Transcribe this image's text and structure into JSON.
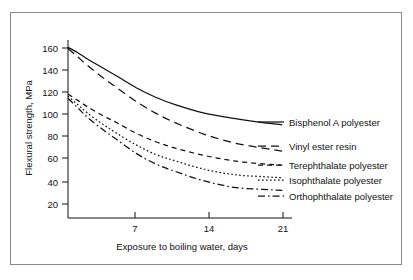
{
  "figure": {
    "border_color": "#8a8a8a",
    "background": "#ffffff",
    "ink_color": "#111111"
  },
  "chart_data": {
    "type": "line",
    "title": "",
    "xlabel": "Exposure to boiling water, days",
    "ylabel": "Flexural strength, MPa",
    "xlim": [
      0,
      23
    ],
    "ylim": [
      7,
      175
    ],
    "xticks": [
      7,
      14,
      21
    ],
    "xtick_labels": [
      "7",
      "14",
      "21"
    ],
    "yticks": [
      20,
      40,
      60,
      80,
      100,
      120,
      140,
      160
    ],
    "ytick_labels": [
      "20",
      "40",
      "60",
      "80",
      "100",
      "120",
      "140",
      "160"
    ],
    "grid": false,
    "legend_position": "right-inline-end-of-line",
    "x": [
      0,
      1,
      2,
      3.5,
      5,
      7,
      9,
      11,
      14,
      17,
      20,
      22
    ],
    "series": [
      {
        "name": "Bisphenol A polyester",
        "style": "solid",
        "values": [
          168,
          163,
          157,
          149,
          141,
          130,
          121,
          114,
          106,
          101,
          97,
          95
        ]
      },
      {
        "name": "Vinyl ester resin",
        "style": "long-dash",
        "values": [
          167,
          159,
          151,
          140,
          130,
          117,
          106,
          97,
          86,
          78,
          73,
          70
        ]
      },
      {
        "name": "Terephthalate polyester",
        "style": "short-dash",
        "values": [
          124,
          118,
          112,
          104,
          97,
          87,
          79,
          73,
          66,
          61,
          58,
          57
        ]
      },
      {
        "name": "Isophthalate polyester",
        "style": "dotted",
        "values": [
          122,
          114,
          106,
          96,
          87,
          76,
          67,
          61,
          53,
          48,
          46,
          45
        ]
      },
      {
        "name": "Orthophthalate polyester",
        "style": "dash-dot",
        "values": [
          120,
          111,
          102,
          91,
          81,
          68,
          58,
          51,
          42,
          36,
          34,
          33
        ]
      }
    ]
  },
  "axes": {
    "x_title": "Exposure to boiling water, days",
    "y_title": "Flexural strength, MPa",
    "x_tick_labels": [
      "7",
      "14",
      "21"
    ],
    "y_tick_labels": [
      "20",
      "40",
      "60",
      "80",
      "100",
      "120",
      "140",
      "160"
    ]
  },
  "legend": {
    "entries": [
      {
        "label": "Bisphenol A polyester",
        "style": "solid"
      },
      {
        "label": "Vinyl ester resin",
        "style": "long-dash"
      },
      {
        "label": "Terephthalate polyester",
        "style": "short-dash"
      },
      {
        "label": "Isophthalate polyester",
        "style": "dotted"
      },
      {
        "label": "Orthophthalate polyester",
        "style": "dash-dot"
      }
    ]
  }
}
